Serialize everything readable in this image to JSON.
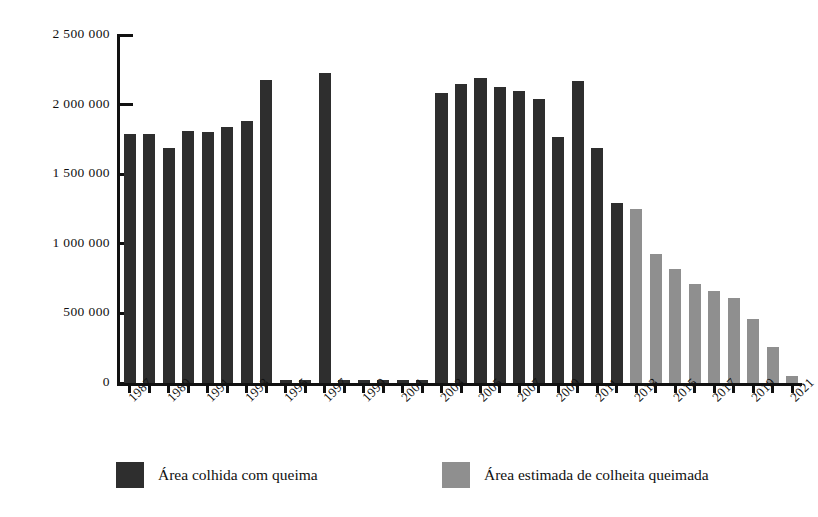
{
  "chart_data": {
    "type": "bar",
    "title": "",
    "subtitle": "",
    "xlabel": "",
    "ylabel": "",
    "grid": false,
    "legend_position": "bottom",
    "ylim": [
      0,
      2500000
    ],
    "ytick_values": [
      0,
      500000,
      1000000,
      1500000,
      2000000,
      2500000
    ],
    "ytick_labels": [
      "0",
      "500 000",
      "1 000 000",
      "1 500 000",
      "2 000 000",
      "2 500 000"
    ],
    "x": [
      1987,
      1988,
      1989,
      1990,
      1991,
      1992,
      1993,
      1994,
      1995,
      1996,
      1997,
      1998,
      1999,
      2000,
      2001,
      2002,
      2003,
      2004,
      2005,
      2006,
      2007,
      2008,
      2009,
      2010,
      2011,
      2012,
      2013,
      2014,
      2015,
      2016,
      2017,
      2018,
      2019,
      2020,
      2021
    ],
    "xtick_labels": [
      "1987",
      "1989",
      "1991",
      "1993",
      "1995",
      "1997",
      "1999",
      "2001",
      "2003",
      "2005",
      "2007",
      "2009",
      "2011",
      "2013",
      "2015",
      "2017",
      "2019",
      "2021"
    ],
    "xtick_years": [
      1987,
      1989,
      1991,
      1993,
      1995,
      1997,
      1999,
      2001,
      2003,
      2005,
      2007,
      2009,
      2011,
      2013,
      2015,
      2017,
      2019,
      2021
    ],
    "series": [
      {
        "name": "Área colhida com queima",
        "color": "#2e2e2e",
        "values": [
          1790000,
          1790000,
          1690000,
          1810000,
          1800000,
          1840000,
          1880000,
          2180000,
          20000,
          20000,
          2230000,
          20000,
          20000,
          20000,
          20000,
          20000,
          2080000,
          2150000,
          2190000,
          2130000,
          2100000,
          2040000,
          1770000,
          2170000,
          1690000,
          1290000,
          null,
          null,
          null,
          null,
          null,
          null,
          null,
          null,
          null
        ]
      },
      {
        "name": "Área estimada de colheita queimada",
        "color": "#8f8f8f",
        "values": [
          null,
          null,
          null,
          null,
          null,
          null,
          null,
          null,
          null,
          null,
          null,
          null,
          null,
          null,
          null,
          null,
          null,
          null,
          null,
          null,
          null,
          null,
          null,
          null,
          null,
          null,
          1250000,
          930000,
          820000,
          710000,
          660000,
          610000,
          460000,
          260000,
          50000
        ]
      }
    ]
  },
  "legend": {
    "items": [
      {
        "label": "Área colhida com queima",
        "color": "#2e2e2e",
        "key": "harvested"
      },
      {
        "label": "Área estimada de colheita queimada",
        "color": "#8f8f8f",
        "key": "estimated"
      }
    ]
  }
}
